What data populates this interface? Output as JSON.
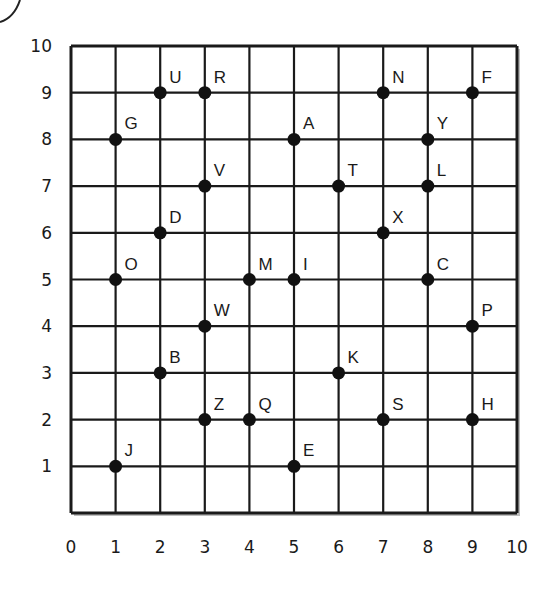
{
  "chart_data": {
    "type": "scatter",
    "title": "",
    "xlabel": "",
    "ylabel": "",
    "xlim": [
      0,
      10
    ],
    "ylim": [
      0,
      10
    ],
    "grid": true,
    "x_ticks": [
      "0",
      "1",
      "2",
      "3",
      "4",
      "5",
      "6",
      "7",
      "8",
      "9",
      "10"
    ],
    "y_ticks": [
      "1",
      "2",
      "3",
      "4",
      "5",
      "6",
      "7",
      "8",
      "9",
      "10"
    ],
    "points": [
      {
        "label": "U",
        "x": 2,
        "y": 9
      },
      {
        "label": "R",
        "x": 3,
        "y": 9
      },
      {
        "label": "N",
        "x": 7,
        "y": 9
      },
      {
        "label": "F",
        "x": 9,
        "y": 9
      },
      {
        "label": "G",
        "x": 1,
        "y": 8
      },
      {
        "label": "A",
        "x": 5,
        "y": 8
      },
      {
        "label": "Y",
        "x": 8,
        "y": 8
      },
      {
        "label": "V",
        "x": 3,
        "y": 7
      },
      {
        "label": "T",
        "x": 6,
        "y": 7
      },
      {
        "label": "L",
        "x": 8,
        "y": 7
      },
      {
        "label": "D",
        "x": 2,
        "y": 6
      },
      {
        "label": "X",
        "x": 7,
        "y": 6
      },
      {
        "label": "O",
        "x": 1,
        "y": 5
      },
      {
        "label": "M",
        "x": 4,
        "y": 5
      },
      {
        "label": "I",
        "x": 5,
        "y": 5
      },
      {
        "label": "C",
        "x": 8,
        "y": 5
      },
      {
        "label": "W",
        "x": 3,
        "y": 4
      },
      {
        "label": "P",
        "x": 9,
        "y": 4
      },
      {
        "label": "B",
        "x": 2,
        "y": 3
      },
      {
        "label": "K",
        "x": 6,
        "y": 3
      },
      {
        "label": "Z",
        "x": 3,
        "y": 2
      },
      {
        "label": "Q",
        "x": 4,
        "y": 2
      },
      {
        "label": "S",
        "x": 7,
        "y": 2
      },
      {
        "label": "H",
        "x": 9,
        "y": 2
      },
      {
        "label": "J",
        "x": 1,
        "y": 1
      },
      {
        "label": "E",
        "x": 5,
        "y": 1
      }
    ]
  }
}
